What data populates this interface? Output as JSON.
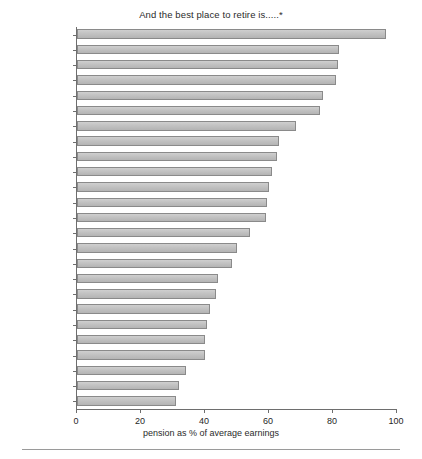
{
  "chart_data": {
    "type": "bar",
    "orientation": "horizontal",
    "title": "And the best place to retire is.....*",
    "xlabel": "pension as % of average earnings",
    "ylabel": "",
    "xlim": [
      0,
      100
    ],
    "xticks": [
      0,
      20,
      40,
      60,
      80,
      100
    ],
    "grid": false,
    "legend": null,
    "categories": [
      "Greece",
      "N'lands",
      "Spain",
      "Austria",
      "Hungary",
      "Denmark",
      "Italy",
      "Finland",
      "Sweden",
      "Poland",
      "Norway",
      "OECD",
      "Switz.",
      "Portugal",
      "France",
      "Czech Rep.",
      "Canada",
      "Australia",
      "US",
      "Belgium",
      "Germany",
      "New Zealand",
      "Japan",
      "Ireland",
      "UK"
    ],
    "values": [
      96.5,
      82,
      81.5,
      81,
      77,
      76,
      68.5,
      63,
      62.5,
      61,
      60,
      59.5,
      59,
      54,
      50,
      48.5,
      44,
      43.5,
      41.5,
      40.5,
      40,
      40,
      34,
      32,
      31
    ],
    "bar_color": "#c2c2c2",
    "bar_edge_color": "#8a8a8a",
    "axis_color": "#6e6e6e"
  }
}
